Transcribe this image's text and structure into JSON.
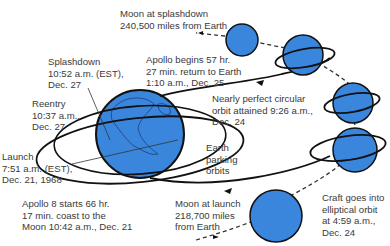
{
  "colors": {
    "planet": "#3a86dc",
    "outline": "#111111",
    "text": "#3a3a3a"
  },
  "labels": {
    "moon_splashdown": [
      "Moon at splashdown",
      "240,500 miles from Earth"
    ],
    "return": [
      "Apollo begins 57 hr.",
      "27 min. return to Earth",
      "1:10 a.m., Dec. 25"
    ],
    "splashdown": [
      "Splashdown",
      "10:52 a.m. (EST),",
      "Dec. 27"
    ],
    "reentry": [
      "Reentry",
      "10:37 a.m.,",
      "Dec. 27"
    ],
    "circular_orbit": [
      "Nearly perfect circular",
      "orbit attained 9:26 a.m.,",
      "Dec. 24"
    ],
    "parking": [
      "Earth",
      "parking",
      "orbits"
    ],
    "launch": [
      "Launch",
      "7:51 a.m. (EST),",
      "Dec. 21, 1968"
    ],
    "coast": [
      "Apollo 8 starts 66 hr.",
      "17 min. coast to the",
      "Moon 10:42 a.m., Dec. 21"
    ],
    "moon_launch": [
      "Moon at launch",
      "218,700 miles",
      "from Earth"
    ],
    "elliptical": [
      "Craft goes into",
      "elliptical orbit",
      "at 4:59 a.m.,",
      "Dec. 24"
    ]
  }
}
